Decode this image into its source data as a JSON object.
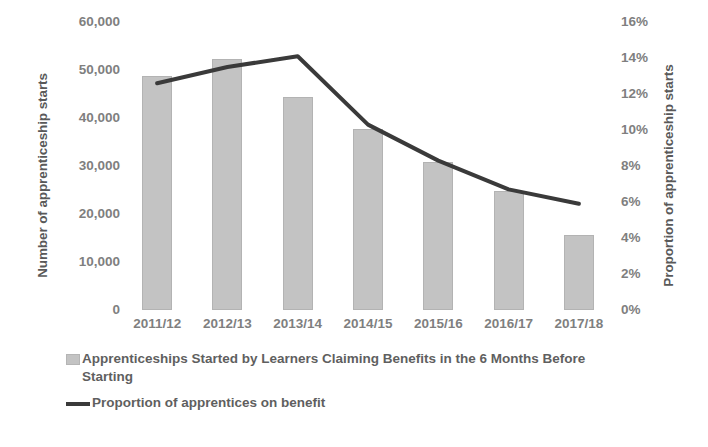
{
  "chart_data": {
    "type": "bar",
    "title": "",
    "categories": [
      "2011/12",
      "2012/13",
      "2013/14",
      "2014/15",
      "2015/16",
      "2016/17",
      "2017/18"
    ],
    "series": [
      {
        "name": "Apprenticeships Started by Learners Claiming Benefits in the 6 Months Before Starting",
        "type": "bar",
        "axis": "left",
        "values": [
          48700,
          52300,
          44400,
          37800,
          30900,
          24800,
          15600
        ]
      },
      {
        "name": "Proportion of apprentices on benefit",
        "type": "line",
        "axis": "right",
        "values": [
          12.6,
          13.5,
          14.1,
          10.3,
          8.3,
          6.7,
          5.9
        ]
      }
    ],
    "xlabel": "",
    "ylabel": "Number of apprenticeship starts",
    "y2label": "Proportion of apprenticeship starts",
    "ylim": [
      0,
      60000
    ],
    "y2lim": [
      0,
      16
    ],
    "yticks": [
      0,
      10000,
      20000,
      30000,
      40000,
      50000,
      60000
    ],
    "ytick_labels": [
      "0",
      "10,000",
      "20,000",
      "30,000",
      "40,000",
      "50,000",
      "60,000"
    ],
    "y2ticks": [
      0,
      2,
      4,
      6,
      8,
      10,
      12,
      14,
      16
    ],
    "y2tick_labels": [
      "0%",
      "2%",
      "4%",
      "6%",
      "8%",
      "10%",
      "12%",
      "14%",
      "16%"
    ],
    "grid": false,
    "legend_position": "bottom-left",
    "colors": {
      "bar": "#c3c3c3",
      "bar_edge": "#b3b3b3",
      "line": "#3a3a3a",
      "text": "#7f7f7f",
      "axis_title": "#595959",
      "background": "#ffffff"
    }
  },
  "legend": {
    "bar_label": "Apprenticeships Started by Learners Claiming Benefits in the 6 Months Before Starting",
    "line_label": "Proportion of apprentices on benefit"
  }
}
